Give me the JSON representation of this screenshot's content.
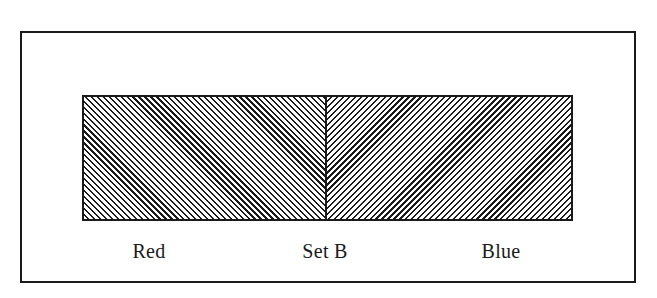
{
  "diagram": {
    "type": "partitioned-rectangle",
    "frame": {
      "stroke": "#1a1a1a",
      "background": "#ffffff"
    },
    "set": {
      "label": "Set B",
      "regions": [
        {
          "name": "Red",
          "hatch": "diagonal-backslash"
        },
        {
          "name": "Blue",
          "hatch": "diagonal-slash"
        }
      ]
    },
    "labels": {
      "left": "Red",
      "center": "Set B",
      "right": "Blue"
    }
  }
}
